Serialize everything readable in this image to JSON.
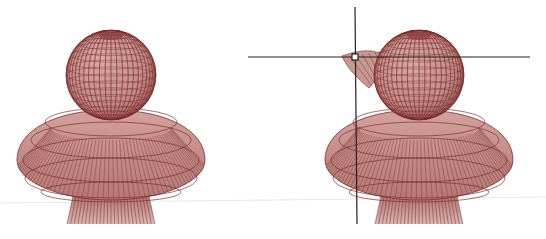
{
  "figure": {
    "panels": [
      {
        "id": "original",
        "label": "original-mesh",
        "deformed": false
      },
      {
        "id": "deformed",
        "label": "deformed-mesh",
        "deformed": true
      }
    ],
    "colors": {
      "mesh_fill": "#c9918c",
      "mesh_fill_dark": "#a86a66",
      "mesh_line": "#7a2e2c",
      "crosshair": "#222222",
      "floor_line": "#e6e6e6",
      "background": "#ffffff"
    },
    "crosshair": {
      "visible": true,
      "handle": "square-handle"
    }
  }
}
